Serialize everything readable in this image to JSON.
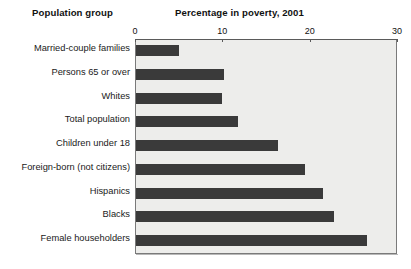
{
  "headers": {
    "left": "Population group",
    "right": "Percentage in poverty, 2001"
  },
  "chart_data": {
    "type": "bar",
    "orientation": "horizontal",
    "title": "Percentage in poverty, 2001",
    "subtitle": "",
    "xlabel": "Percentage in poverty, 2001",
    "ylabel": "Population group",
    "xlim": [
      0,
      30
    ],
    "ylim": null,
    "grid": false,
    "legend": null,
    "legend_position": "none",
    "xticks": [
      0,
      10,
      20,
      30
    ],
    "xtick_labels": [
      "0",
      "10",
      "20",
      "30"
    ],
    "categories": [
      "Married-couple families",
      "Persons 65 or over",
      "Whites",
      "Total population",
      "Children under 18",
      "Foreign-born (not citizens)",
      "Hispanics",
      "Blacks",
      "Female householders"
    ],
    "values": [
      4.9,
      10.1,
      9.9,
      11.7,
      16.3,
      19.4,
      21.4,
      22.7,
      26.4
    ],
    "bar_color": "#3a3a3a",
    "plot_background": "#ededeb",
    "frame_color": "#7a7a7a"
  }
}
